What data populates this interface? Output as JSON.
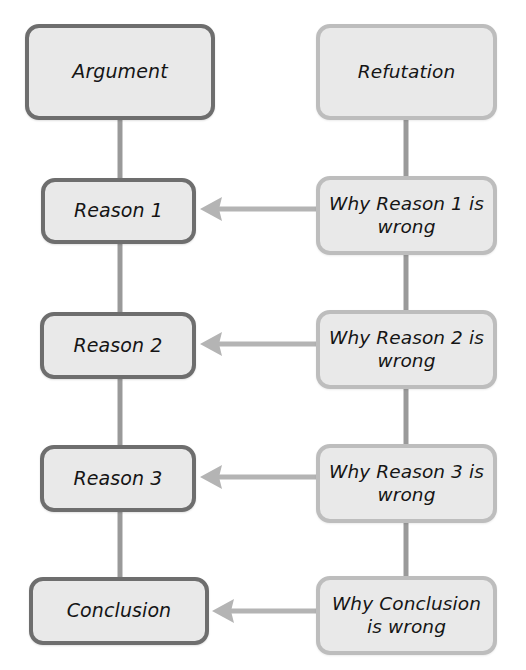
{
  "diagram": {
    "background_color": "#ffffff",
    "columns": [
      {
        "key": "argument",
        "heading": "Argument side",
        "border_color": "#6e6e6e",
        "fill_color": "#e9e9e9"
      },
      {
        "key": "refutation",
        "heading": "Refutation side",
        "border_color": "#bdbdbd",
        "fill_color": "#e9e9e9"
      }
    ],
    "connector_color": "#9a9a9a",
    "arrow_color": "#b4b4b4",
    "nodes": {
      "argument": "Argument",
      "reason_1": "Reason 1",
      "reason_2": "Reason 2",
      "reason_3": "Reason 3",
      "conclusion": "Conclusion",
      "refutation": "Refutation",
      "why_reason_1_wrong": "Why Reason 1 is\nwrong",
      "why_reason_2_wrong": "Why Reason 2 is\nwrong",
      "why_reason_3_wrong": "Why Reason 3 is\nwrong",
      "why_conclusion_wrong": "Why Conclusion\nis wrong"
    },
    "edges": [
      {
        "from": "argument",
        "to": "reason_1",
        "kind": "vertical"
      },
      {
        "from": "reason_1",
        "to": "reason_2",
        "kind": "vertical"
      },
      {
        "from": "reason_2",
        "to": "reason_3",
        "kind": "vertical"
      },
      {
        "from": "reason_3",
        "to": "conclusion",
        "kind": "vertical"
      },
      {
        "from": "refutation",
        "to": "why_reason_1_wrong",
        "kind": "vertical"
      },
      {
        "from": "why_reason_1_wrong",
        "to": "why_reason_2_wrong",
        "kind": "vertical"
      },
      {
        "from": "why_reason_2_wrong",
        "to": "why_reason_3_wrong",
        "kind": "vertical"
      },
      {
        "from": "why_reason_3_wrong",
        "to": "why_conclusion_wrong",
        "kind": "vertical"
      },
      {
        "from": "why_reason_1_wrong",
        "to": "reason_1",
        "kind": "arrow-left"
      },
      {
        "from": "why_reason_2_wrong",
        "to": "reason_2",
        "kind": "arrow-left"
      },
      {
        "from": "why_reason_3_wrong",
        "to": "reason_3",
        "kind": "arrow-left"
      },
      {
        "from": "why_conclusion_wrong",
        "to": "conclusion",
        "kind": "arrow-left"
      }
    ]
  }
}
